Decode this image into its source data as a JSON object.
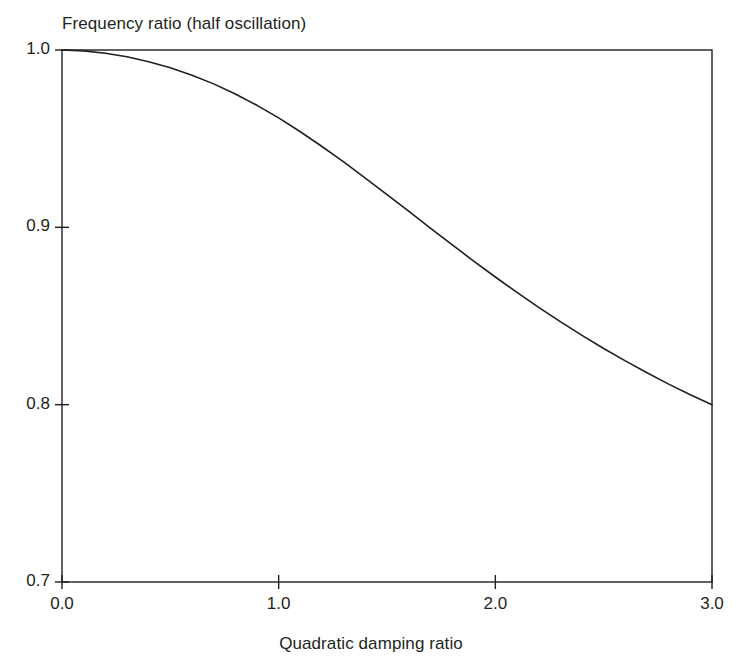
{
  "chart_data": {
    "type": "line",
    "title": "Frequency ratio (half oscillation)",
    "xlabel": "Quadratic damping ratio",
    "ylabel": "",
    "xlim": [
      0.0,
      3.0
    ],
    "ylim": [
      0.7,
      1.0
    ],
    "grid": false,
    "legend": null,
    "xticks": [
      "0.0",
      "1.0",
      "2.0",
      "3.0"
    ],
    "xtick_values": [
      0.0,
      1.0,
      2.0,
      3.0
    ],
    "yticks": [
      "0.7",
      "0.8",
      "0.9",
      "1.0"
    ],
    "ytick_values": [
      0.7,
      0.8,
      0.9,
      1.0
    ],
    "series": [
      {
        "name": "Frequency ratio",
        "color": "#231f20",
        "x": [
          0.0,
          0.1,
          0.2,
          0.3,
          0.4,
          0.5,
          0.6,
          0.7,
          0.8,
          0.9,
          1.0,
          1.1,
          1.2,
          1.3,
          1.4,
          1.5,
          1.6,
          1.7,
          1.8,
          1.9,
          2.0,
          2.1,
          2.2,
          2.3,
          2.4,
          2.5,
          2.6,
          2.7,
          2.8,
          2.9,
          3.0
        ],
        "y": [
          1.0,
          0.9995,
          0.9982,
          0.9962,
          0.9934,
          0.99,
          0.9858,
          0.9809,
          0.9752,
          0.9688,
          0.9617,
          0.9539,
          0.9456,
          0.9369,
          0.9278,
          0.9185,
          0.9091,
          0.8996,
          0.8902,
          0.881,
          0.872,
          0.8633,
          0.8549,
          0.8468,
          0.8391,
          0.8317,
          0.8247,
          0.818,
          0.8116,
          0.8056,
          0.7999
        ]
      }
    ]
  },
  "labels": {
    "title": "Frequency ratio (half oscillation)",
    "xaxis": "Quadratic damping ratio"
  }
}
